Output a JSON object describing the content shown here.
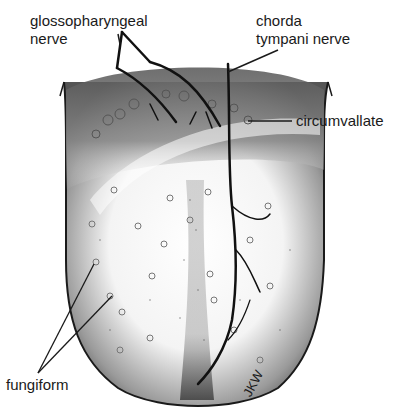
{
  "figure": {
    "labels": {
      "glossopharyngeal": "glossopharyngeal\nnerve",
      "chorda": "chorda\ntympani nerve",
      "circumvallate": "circumvallate",
      "fungiform": "fungiform"
    },
    "signature": "JKW",
    "caption": "Figure 1. Tongue showing taste buds, papillae and nerve innervation"
  },
  "colors": {
    "ink": "#1a1a1a",
    "shade_dark": "#555555",
    "paper": "#ffffff"
  }
}
